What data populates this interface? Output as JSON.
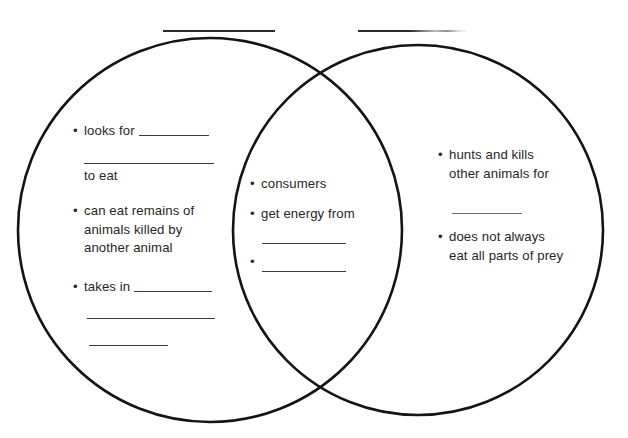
{
  "worksheet": {
    "type": "venn-diagram",
    "title_blanks": [
      {
        "name": "left-circle-title-blank",
        "value": ""
      },
      {
        "name": "right-circle-title-blank",
        "value": ""
      }
    ]
  },
  "left_circle": {
    "label": "Left circle — scavenger traits",
    "items": [
      {
        "id": "left-item-1",
        "text": "• looks for",
        "bullet": "•",
        "body": "looks for",
        "has_inline_blank": true,
        "continuation": "to eat"
      },
      {
        "id": "left-item-2",
        "bullet": "•",
        "body": "can eat remains of",
        "line2": "animals killed by",
        "line3": "another animal"
      },
      {
        "id": "left-item-3",
        "bullet": "•",
        "body": "takes in",
        "has_inline_blank": true
      }
    ],
    "blank_lines": 3
  },
  "center_overlap": {
    "label": "Overlap — shared traits",
    "items": [
      {
        "id": "center-item-1",
        "bullet": "•",
        "body": "consumers"
      },
      {
        "id": "center-item-2",
        "bullet": "•",
        "body": "get energy from"
      },
      {
        "id": "center-item-3",
        "bullet": "•",
        "body": ""
      }
    ],
    "blank_lines": 2
  },
  "right_circle": {
    "label": "Right circle — predator traits",
    "items": [
      {
        "id": "right-item-1",
        "bullet": "•",
        "body": "hunts and kills",
        "line2": "other animals for"
      },
      {
        "id": "right-item-2",
        "bullet": "•",
        "body": "does not always",
        "line2": "eat all parts of prey"
      }
    ],
    "blank_lines": 1
  },
  "colors": {
    "background": "#ffffff",
    "stroke": "#141414",
    "text": "#262626",
    "rule": "#3a3a3a"
  }
}
